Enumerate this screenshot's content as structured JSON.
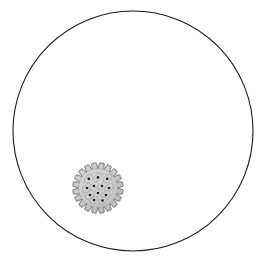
{
  "canvas": {
    "width": 275,
    "height": 271,
    "background_color": "#ffffff",
    "label": "Single gear inside a large circular boundary"
  },
  "boundary_circle": {
    "name": "boundary-circle",
    "center_x": 133,
    "center_y": 131,
    "radius": 120,
    "stroke_color": "#1a1a1a",
    "stroke_width": 1.1,
    "fill_color": "none"
  },
  "gear": {
    "name": "gear-object",
    "center_x": 98,
    "center_y": 188,
    "outer_radius": 25,
    "root_radius": 19.5,
    "hub_radius": 15.5,
    "tooth_count": 20,
    "body_fill": "#c2c2c2",
    "body_stroke": "#6e6e6e",
    "body_stroke_width": 0.9,
    "highlight_fill": "#e2e2e2",
    "cell_fill": "#d2d2d2",
    "cell_stroke": "#7a7a7a",
    "dot_color": "#1d1d1d",
    "dot_radius": 1.35,
    "cells": [
      {
        "cx": -9.2,
        "cy": -9.2,
        "rx": 5.2,
        "ry": 3.4,
        "rot": -45
      },
      {
        "cx": 0.0,
        "cy": -10.6,
        "rx": 5.2,
        "ry": 3.4,
        "rot": -45
      },
      {
        "cx": 9.2,
        "cy": -9.2,
        "rx": 5.2,
        "ry": 3.4,
        "rot": -45
      },
      {
        "cx": -11.0,
        "cy": 0.0,
        "rx": 5.2,
        "ry": 3.4,
        "rot": -45
      },
      {
        "cx": -4.0,
        "cy": -2.0,
        "rx": 5.2,
        "ry": 3.4,
        "rot": -45
      },
      {
        "cx": 4.0,
        "cy": -2.0,
        "rx": 5.2,
        "ry": 3.4,
        "rot": -45
      },
      {
        "cx": 11.0,
        "cy": 0.0,
        "rx": 5.2,
        "ry": 3.4,
        "rot": -45
      },
      {
        "cx": -8.0,
        "cy": 7.0,
        "rx": 5.2,
        "ry": 3.4,
        "rot": -45
      },
      {
        "cx": 0.0,
        "cy": 5.0,
        "rx": 5.2,
        "ry": 3.4,
        "rot": -45
      },
      {
        "cx": 8.0,
        "cy": 7.0,
        "rx": 5.2,
        "ry": 3.4,
        "rot": -45
      },
      {
        "cx": -4.0,
        "cy": 12.0,
        "rx": 4.6,
        "ry": 3.0,
        "rot": -45
      },
      {
        "cx": 4.5,
        "cy": 12.5,
        "rx": 4.6,
        "ry": 3.0,
        "rot": -45
      }
    ]
  }
}
